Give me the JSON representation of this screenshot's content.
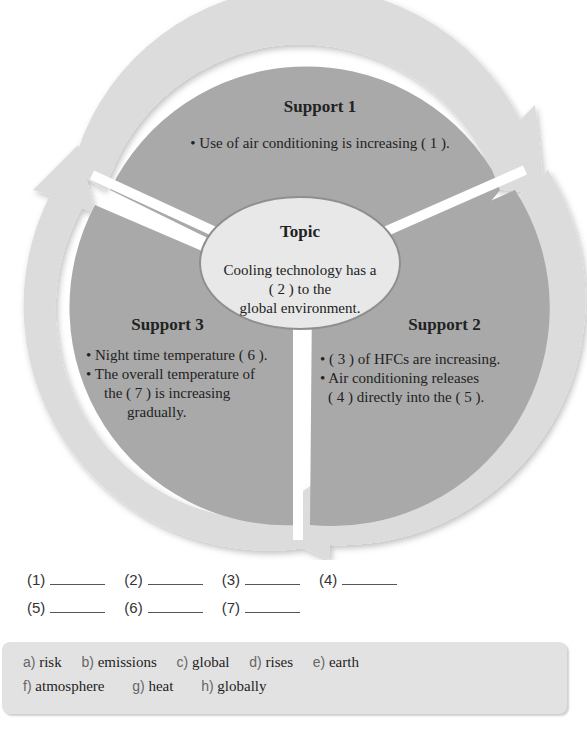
{
  "diagram": {
    "colors": {
      "segment_fill": "#a9a9a9",
      "arrow_fill": "#dcdcdc",
      "topic_fill": "#e8e8e8",
      "topic_border": "#8f8f8f"
    },
    "support1": {
      "title": "Support 1",
      "bullets": [
        "• Use of air conditioning is increasing ( 1 )."
      ]
    },
    "topic": {
      "title": "Topic",
      "lines": [
        "Cooling technology has a",
        "( 2 ) to the",
        "global environment."
      ]
    },
    "support2": {
      "title": "Support 2",
      "lines": [
        "• ( 3 ) of HFCs are increasing.",
        "• Air conditioning releases",
        "( 4 ) directly into the ( 5 )."
      ]
    },
    "support3": {
      "title": "Support 3",
      "lines": [
        "• Night time temperature ( 6 ).",
        "• The overall temperature of",
        "the ( 7 ) is increasing",
        "gradually."
      ]
    }
  },
  "blanks": {
    "row1": [
      "(1)",
      "(2)",
      "(3)",
      "(4)"
    ],
    "row2": [
      "(5)",
      "(6)",
      "(7)"
    ]
  },
  "word_bank": {
    "row1": [
      {
        "letter": "a)",
        "word": "risk"
      },
      {
        "letter": "b)",
        "word": "emissions"
      },
      {
        "letter": "c)",
        "word": "global"
      },
      {
        "letter": "d)",
        "word": "rises"
      },
      {
        "letter": "e)",
        "word": "earth"
      }
    ],
    "row2": [
      {
        "letter": "f)",
        "word": "atmosphere"
      },
      {
        "letter": "g)",
        "word": "heat"
      },
      {
        "letter": "h)",
        "word": "globally"
      }
    ]
  }
}
